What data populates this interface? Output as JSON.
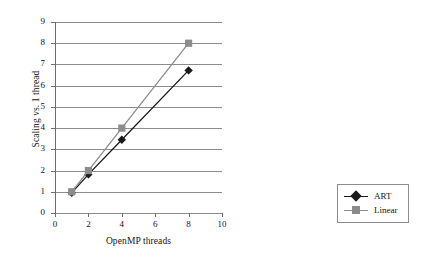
{
  "chart_data": {
    "type": "line",
    "title": "",
    "xlabel": "OpenMP threads",
    "ylabel": "Scaling vs. 1 thread",
    "x": [
      1,
      2,
      4,
      8
    ],
    "xlim": [
      0,
      10
    ],
    "ylim": [
      0,
      9
    ],
    "xticks": [
      0,
      2,
      4,
      6,
      8,
      10
    ],
    "yticks": [
      0,
      1,
      2,
      3,
      4,
      5,
      6,
      7,
      8,
      9
    ],
    "grid": "horizontal",
    "legend_position": "right",
    "series": [
      {
        "name": "ART",
        "values": [
          0.95,
          1.82,
          3.45,
          6.72
        ],
        "color": "#1a1a1a",
        "marker": "diamond"
      },
      {
        "name": "Linear",
        "values": [
          1,
          2,
          4,
          8
        ],
        "color": "#8c8c8c",
        "marker": "square"
      }
    ]
  },
  "axes": {
    "y_title": "Scaling vs. 1 thread",
    "x_title": "OpenMP threads",
    "y_tick_labels": [
      "9",
      "8",
      "7",
      "6",
      "5",
      "4",
      "3",
      "2",
      "1",
      "0"
    ],
    "x_tick_labels": [
      "0",
      "2",
      "4",
      "6",
      "8",
      "10"
    ]
  },
  "legend": {
    "items": [
      {
        "label": "ART",
        "marker": "diamond-marker",
        "color": "#1a1a1a"
      },
      {
        "label": "Linear",
        "marker": "square-marker",
        "color": "#8c8c8c"
      }
    ]
  },
  "colors": {
    "grid": "#8c8c8c",
    "axis": "#6e6e6e",
    "art": "#1a1a1a",
    "linear": "#8c8c8c",
    "background": "#ffffff"
  }
}
